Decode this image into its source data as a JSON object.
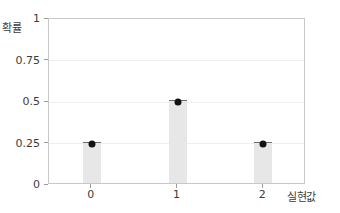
{
  "chart_data": {
    "type": "bar",
    "title": "",
    "subtitle": "",
    "xlabel": "실현값",
    "ylabel": "확률",
    "categories": [
      "0",
      "1",
      "2"
    ],
    "values": [
      0.25,
      0.5,
      0.25
    ],
    "point_values": [
      0.25,
      0.5,
      0.25
    ],
    "series": [
      {
        "name": "확률",
        "values": [
          0.25,
          0.5,
          0.25
        ]
      }
    ],
    "ylim": [
      0,
      1
    ],
    "yticks": [
      "0",
      "0.25",
      "0.5",
      "0.75",
      "1"
    ],
    "ytick_values": [
      0,
      0.25,
      0.5,
      0.75,
      1
    ],
    "xticks": [
      "0",
      "1",
      "2"
    ],
    "grid": true,
    "grid_axis": "y",
    "legend": "none",
    "legend_position": "none",
    "annotations": [],
    "colors": {
      "bar_fill": "#e7e7e7",
      "bar_cap": "#6e6e6e",
      "marker": "#111111",
      "gridline": "#eeeeee",
      "axis_border": "#c8c8c8",
      "text": "#3c3c3c",
      "background": "#ffffff"
    }
  }
}
